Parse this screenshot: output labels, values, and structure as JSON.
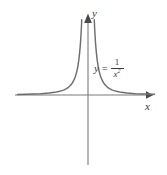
{
  "figure": {
    "background_color": "#ffffff",
    "curve_color": "#6e6e6e",
    "axis_color": "#7a7a7a",
    "text_color": "#3a3a3a"
  },
  "axes": {
    "x_label": "x",
    "y_label": "y",
    "x_axis_name": "horizontal-axis",
    "y_axis_name": "vertical-axis",
    "origin_px": [
      88,
      95
    ],
    "x_axis_extent_px": [
      15,
      152
    ],
    "y_axis_extent_px": [
      16,
      165
    ]
  },
  "equation": {
    "lhs": "y",
    "equals": "=",
    "numerator": "1",
    "denominator": "x",
    "exponent": "2",
    "full_text": "y = 1/x^2"
  },
  "icons": {
    "y_arrowhead": "arrow-up-icon",
    "x_arrowhead": "arrow-right-icon"
  },
  "chart_data": {
    "type": "line",
    "xlabel": "x",
    "ylabel": "y",
    "grid": false,
    "legend": "none",
    "annotations": [
      {
        "text": "y = 1/x^2",
        "x_px": 94,
        "y_px": 58
      }
    ],
    "function": "y = 1 / x^2",
    "asymptotes": {
      "vertical": 0,
      "horizontal": 0
    },
    "xlim": [
      -3.6,
      3.4
    ],
    "ylim": [
      0,
      10
    ],
    "series": [
      {
        "name": "left-branch",
        "x": [
          -3.6,
          -3.2,
          -2.8,
          -2.4,
          -2.0,
          -1.7,
          -1.45,
          -1.25,
          -1.1,
          -1.0,
          -0.9,
          -0.8,
          -0.72,
          -0.65,
          -0.58,
          -0.52,
          -0.47,
          -0.42,
          -0.38,
          -0.345,
          -0.32
        ],
        "y": [
          0.077,
          0.098,
          0.128,
          0.174,
          0.25,
          0.346,
          0.476,
          0.64,
          0.826,
          1.0,
          1.235,
          1.563,
          1.929,
          2.367,
          2.973,
          3.698,
          4.527,
          5.669,
          6.925,
          8.4,
          9.77
        ]
      },
      {
        "name": "right-branch",
        "x": [
          0.32,
          0.345,
          0.38,
          0.42,
          0.47,
          0.52,
          0.58,
          0.65,
          0.72,
          0.8,
          0.9,
          1.0,
          1.1,
          1.25,
          1.45,
          1.7,
          2.0,
          2.4,
          2.8,
          3.2,
          3.4
        ],
        "y": [
          9.77,
          8.4,
          6.925,
          5.669,
          4.527,
          3.698,
          2.973,
          2.367,
          1.929,
          1.563,
          1.235,
          1.0,
          0.826,
          0.64,
          0.476,
          0.346,
          0.25,
          0.174,
          0.128,
          0.098,
          0.087
        ]
      }
    ]
  }
}
